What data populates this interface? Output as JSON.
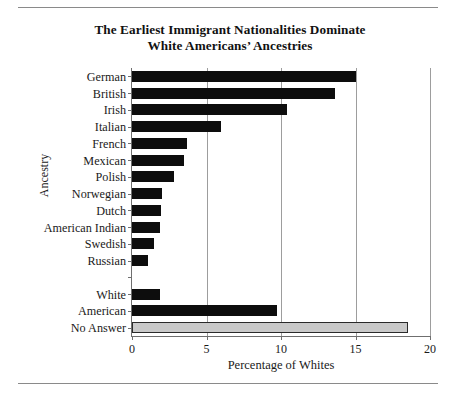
{
  "figure": {
    "title_line1": "The Earliest Immigrant Nationalities Dominate",
    "title_line2": "White Americans’ Ancestries"
  },
  "chart_data": {
    "type": "bar",
    "orientation": "horizontal",
    "title": "The Earliest Immigrant Nationalities Dominate White Americans’ Ancestries",
    "xlabel": "Percentage of Whites",
    "ylabel": "Ancestry",
    "xlim": [
      0,
      20
    ],
    "xticks": [
      0,
      5,
      10,
      15,
      20
    ],
    "xtick_labels": [
      "0",
      "5",
      "10",
      "15",
      "20"
    ],
    "grid": "vertical",
    "legend": "none",
    "categories": [
      "German",
      "British",
      "Irish",
      "Italian",
      "French",
      "Mexican",
      "Polish",
      "Norwegian",
      "Dutch",
      "American Indian",
      "Swedish",
      "Russian",
      "",
      "White",
      "American",
      "No Answer"
    ],
    "values": [
      15.0,
      13.6,
      10.4,
      6.0,
      3.7,
      3.5,
      2.8,
      2.0,
      1.95,
      1.9,
      1.5,
      1.1,
      null,
      1.9,
      9.7,
      18.5
    ],
    "bar_colors": [
      "#0d0d0d",
      "#0d0d0d",
      "#0d0d0d",
      "#0d0d0d",
      "#0d0d0d",
      "#0d0d0d",
      "#0d0d0d",
      "#0d0d0d",
      "#0d0d0d",
      "#0d0d0d",
      "#0d0d0d",
      "#0d0d0d",
      null,
      "#0d0d0d",
      "#0d0d0d",
      "#c9c9c9"
    ],
    "colors": {
      "bar_dark": "#0d0d0d",
      "bar_gray": "#c9c9c9",
      "axis": "#6f6f6f",
      "grid": "#9d9d9d",
      "text": "#1a1a1a",
      "rule": "#8a8a8a"
    }
  }
}
